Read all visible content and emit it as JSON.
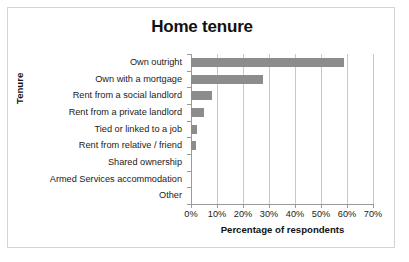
{
  "chart_data": {
    "type": "bar",
    "orientation": "horizontal",
    "title": "Home tenure",
    "xlabel": "Percentage of respondents",
    "ylabel": "Tenure",
    "categories": [
      "Own outright",
      "Own with a mortgage",
      "Rent from a social landlord",
      "Rent from a private landlord",
      "Tied or linked to a job",
      "Rent from relative / friend",
      "Shared ownership",
      "Armed Services accommodation",
      "Other"
    ],
    "values": [
      58.8,
      27.6,
      8.2,
      5.0,
      2.4,
      2.0,
      0,
      0,
      0
    ],
    "value_labels": [
      "58.8%",
      "27.6%",
      "8.2%",
      "5.0%",
      "2.4%",
      "2.0%",
      "0%",
      "0%",
      "0%"
    ],
    "xlim": [
      0,
      70
    ],
    "xticks": [
      0,
      10,
      20,
      30,
      40,
      50,
      60,
      70
    ],
    "xtick_labels": [
      "0%",
      "10%",
      "20%",
      "30%",
      "40%",
      "50%",
      "60%",
      "70%"
    ],
    "grid": "vertical",
    "legend": "none",
    "bar_color": "#8c8c8c",
    "grid_color": "#c8c8c8",
    "axis_color": "#9a9a9a",
    "border_color": "#d4d4d4",
    "background": "#ffffff",
    "text_color": "#1a1a1a"
  }
}
